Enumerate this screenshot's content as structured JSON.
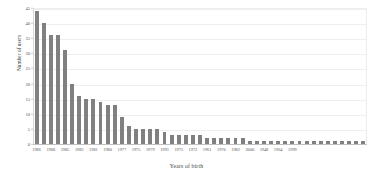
{
  "chart_data": {
    "type": "bar",
    "title": "",
    "xlabel": "Years of birth",
    "ylabel": "Number of users",
    "ylim": [
      0,
      45
    ],
    "yticks": [
      0,
      5,
      10,
      15,
      20,
      25,
      30,
      35,
      40,
      45
    ],
    "grid": true,
    "legend": false,
    "bar_color": "#808080",
    "categories": [
      "1986",
      "1987",
      "1988",
      "1984",
      "1985",
      "1989",
      "1983",
      "1978",
      "1981",
      "1982",
      "1980",
      "1976",
      "1977",
      "1974",
      "1975",
      "1990",
      "1979",
      "1991",
      "1993",
      "1992",
      "1973",
      "1994",
      "1972",
      "1971",
      "1961",
      "1995",
      "1970",
      "1996",
      "1982",
      "1997",
      "2000",
      "1998",
      "1948",
      "1966",
      "1964",
      "1965",
      "1999",
      "1963",
      "1962",
      "1960",
      "1959",
      "1958",
      "1957",
      "1956",
      "1955",
      "1954",
      "1953"
    ],
    "values": [
      44,
      40,
      36,
      36,
      31,
      20,
      16,
      15,
      15,
      14,
      13,
      13,
      9,
      6,
      5,
      5,
      5,
      5,
      4,
      3,
      3,
      3,
      3,
      3,
      2,
      2,
      2,
      2,
      2,
      2,
      1,
      1,
      1,
      1,
      1,
      1,
      1,
      1,
      1,
      1,
      1,
      1,
      1,
      1,
      1,
      1,
      1
    ],
    "xtick_labels": [
      "1986",
      "1988",
      "1985",
      "1983",
      "1981",
      "1980",
      "1977",
      "1975",
      "1979",
      "1993",
      "1973",
      "1972",
      "1961",
      "1970",
      "1982",
      "2000",
      "1948",
      "1964",
      "1999"
    ],
    "xtick_indices": [
      0,
      2,
      4,
      6,
      8,
      10,
      12,
      14,
      16,
      18,
      20,
      22,
      24,
      26,
      28,
      30,
      32,
      34,
      36
    ]
  }
}
